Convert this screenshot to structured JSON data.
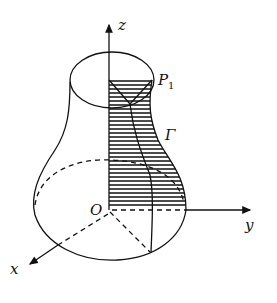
{
  "diagram": {
    "type": "solid-of-revolution",
    "axes": {
      "x": "x",
      "y": "y",
      "z": "z",
      "origin": "O"
    },
    "labels": {
      "point": "P",
      "point_sub": "1",
      "curve": "Γ"
    },
    "colors": {
      "stroke": "#111111",
      "background": "#ffffff"
    }
  }
}
